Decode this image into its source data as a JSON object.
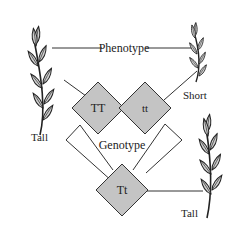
{
  "labels": {
    "phenotype": "Phenotype",
    "genotype": "Genotype",
    "short": "Short",
    "tall_left": "Tall",
    "tall_right": "Tall"
  },
  "genotypes": {
    "parent1": "TT",
    "parent2": "tt",
    "offspring": "Tt"
  },
  "colors": {
    "diamond_fill": "#c4c4c4",
    "stroke": "#333333",
    "leaf_fill": "#d0d0d0"
  }
}
